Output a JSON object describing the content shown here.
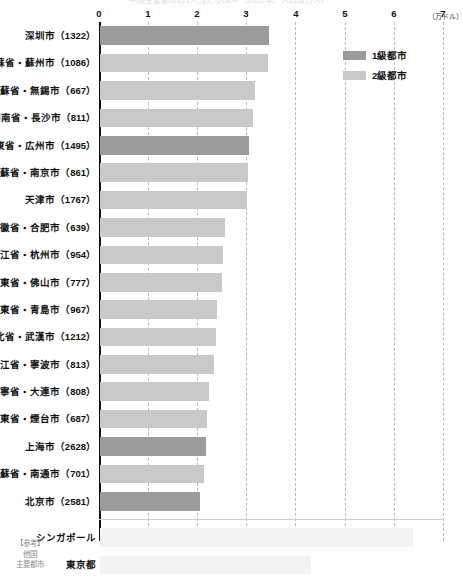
{
  "chart_data": {
    "type": "bar",
    "orientation": "horizontal",
    "title": "中国主要都市の1人当たりGDP（2022年、人口は万人）",
    "xlabel": "",
    "ylabel": "",
    "unit_label": "（万ドル）",
    "xlim": [
      0,
      7
    ],
    "xticks": [
      "0",
      "1",
      "2",
      "3",
      "4",
      "5",
      "6",
      "7"
    ],
    "grid": "vertical-dashed",
    "legend_position": "top-right",
    "legend": [
      {
        "label": "1級都市",
        "color": "#9b9b9b",
        "key": "tier1"
      },
      {
        "label": "2級都市",
        "color": "#c9c9c9",
        "key": "tier2"
      }
    ],
    "categories": [
      "深圳市（1322）",
      "江蘇省・蘇州市（1086）",
      "江蘇省・無錫市（667）",
      "湖南省・長沙市（811）",
      "広東省・広州市（1495）",
      "江蘇省・南京市（861）",
      "天津市（1767）",
      "安徽省・合肥市（639）",
      "浙江省・杭州市（954）",
      "広東省・佛山市（777）",
      "山東省・青島市（967）",
      "湖北省・武漢市（1212）",
      "浙江省・寧波市（813）",
      "遼寧省・大連市（808）",
      "山東省・煙台市（687）",
      "上海市（2628）",
      "江蘇省・南通市（701）",
      "北京市（2581）"
    ],
    "values": [
      3.44,
      3.42,
      3.16,
      3.12,
      3.04,
      3.01,
      2.99,
      2.55,
      2.5,
      2.48,
      2.38,
      2.36,
      2.32,
      2.22,
      2.18,
      2.16,
      2.12,
      2.04
    ],
    "tiers": [
      "tier1",
      "tier2",
      "tier2",
      "tier2",
      "tier1",
      "tier2",
      "tier2",
      "tier2",
      "tier2",
      "tier2",
      "tier2",
      "tier2",
      "tier2",
      "tier2",
      "tier2",
      "tier1",
      "tier2",
      "tier1"
    ],
    "reference": {
      "note_lines": [
        "【参考】",
        "他国",
        "主要都市"
      ],
      "categories": [
        "シンガポール",
        "東京都"
      ],
      "values": [
        6.38,
        4.3
      ],
      "color": "#f3f3f3"
    }
  }
}
